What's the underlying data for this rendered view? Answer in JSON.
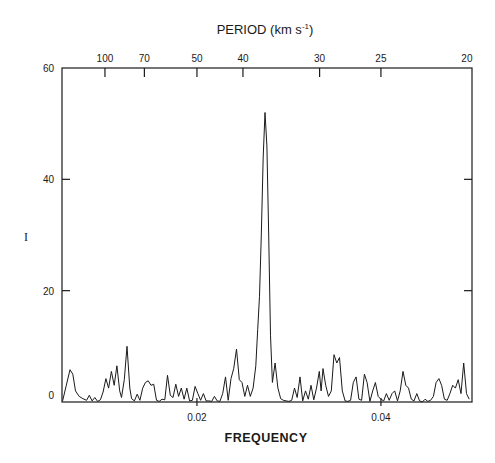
{
  "chart_data": {
    "type": "line",
    "title": "",
    "top_axis_label": "PERIOD (km s",
    "top_axis_label_sup": "-1",
    "top_axis_label_close": ")",
    "xlabel": "FREQUENCY",
    "ylabel": "I",
    "xlim": [
      0.00533,
      0.0499
    ],
    "ylim": [
      0,
      60
    ],
    "y_ticks": [
      0,
      20,
      40,
      60
    ],
    "y_tick_labels": [
      "0",
      "20",
      "40",
      "60"
    ],
    "x_ticks": [
      0.02,
      0.04
    ],
    "x_tick_labels": [
      "0.02",
      "0.04"
    ],
    "top_ticks_period": [
      100,
      70,
      50,
      40,
      30,
      25,
      20
    ],
    "top_tick_labels": [
      "100",
      "70",
      "50",
      "40",
      "30",
      "25",
      "20"
    ],
    "grid": false,
    "legend": null,
    "line_color": "#1a1a1a",
    "series": [
      {
        "name": "power spectrum",
        "x": [
          0.0054,
          0.0058,
          0.0062,
          0.0065,
          0.0068,
          0.0072,
          0.0076,
          0.008,
          0.0083,
          0.0086,
          0.0089,
          0.0092,
          0.0095,
          0.0098,
          0.0101,
          0.0104,
          0.0107,
          0.011,
          0.0113,
          0.0116,
          0.0118,
          0.0121,
          0.0124,
          0.0127,
          0.0129,
          0.0132,
          0.0135,
          0.0138,
          0.0141,
          0.0144,
          0.0147,
          0.015,
          0.0153,
          0.0156,
          0.0159,
          0.0162,
          0.0165,
          0.0168,
          0.0171,
          0.0174,
          0.0177,
          0.018,
          0.0183,
          0.0186,
          0.0189,
          0.0192,
          0.0195,
          0.0198,
          0.0201,
          0.0204,
          0.0207,
          0.021,
          0.0213,
          0.0216,
          0.0219,
          0.0222,
          0.0225,
          0.0228,
          0.0231,
          0.0234,
          0.0237,
          0.024,
          0.0243,
          0.0246,
          0.0249,
          0.0252,
          0.0255,
          0.0258,
          0.0261,
          0.0264,
          0.0266,
          0.0268,
          0.027,
          0.0272,
          0.0274,
          0.0276,
          0.0278,
          0.028,
          0.0282,
          0.0285,
          0.0288,
          0.0291,
          0.0294,
          0.0297,
          0.03,
          0.0303,
          0.0306,
          0.0309,
          0.0312,
          0.0315,
          0.0318,
          0.0321,
          0.0324,
          0.0327,
          0.033,
          0.0333,
          0.0335,
          0.0337,
          0.034,
          0.0343,
          0.0346,
          0.0349,
          0.0352,
          0.0355,
          0.0358,
          0.0361,
          0.0364,
          0.0367,
          0.037,
          0.0373,
          0.0376,
          0.0379,
          0.0382,
          0.0385,
          0.0388,
          0.0391,
          0.0394,
          0.0397,
          0.04,
          0.0403,
          0.0406,
          0.0409,
          0.0412,
          0.0415,
          0.0418,
          0.0421,
          0.0424,
          0.0427,
          0.043,
          0.0433,
          0.0436,
          0.0439,
          0.0442,
          0.0445,
          0.0448,
          0.0451,
          0.0454,
          0.0457,
          0.046,
          0.0463,
          0.0466,
          0.0469,
          0.0472,
          0.0475,
          0.0478,
          0.0481,
          0.0484,
          0.0487,
          0.049,
          0.0493,
          0.0496
        ],
        "y": [
          0.2,
          3.0,
          5.8,
          5.0,
          2.0,
          1.0,
          0.6,
          0.3,
          1.2,
          0.2,
          0.8,
          0.1,
          0.4,
          1.8,
          4.2,
          2.5,
          5.5,
          3.0,
          6.5,
          2.0,
          0.8,
          4.0,
          10.0,
          2.5,
          0.6,
          0.2,
          1.4,
          0.3,
          2.5,
          3.5,
          3.8,
          3.0,
          3.2,
          0.3,
          0.1,
          0.5,
          0.4,
          4.8,
          1.2,
          0.8,
          3.2,
          1.0,
          2.5,
          0.5,
          2.5,
          0.2,
          0.3,
          2.8,
          1.5,
          0.3,
          1.5,
          0.2,
          0.2,
          0.1,
          1.0,
          0.2,
          0.1,
          1.5,
          4.5,
          0.3,
          4.2,
          6.0,
          9.5,
          4.0,
          3.5,
          1.0,
          3.0,
          1.0,
          2.5,
          6.5,
          13.0,
          19.0,
          30.0,
          44.0,
          52.0,
          46.0,
          30.0,
          12.0,
          3.5,
          7.0,
          2.5,
          0.6,
          0.3,
          0.2,
          0.1,
          0.3,
          2.5,
          0.8,
          4.5,
          0.2,
          2.0,
          0.5,
          3.0,
          0.4,
          2.5,
          5.5,
          2.0,
          6.0,
          3.0,
          1.0,
          2.0,
          8.5,
          7.0,
          8.0,
          2.0,
          0.2,
          0.1,
          0.3,
          3.5,
          4.5,
          0.5,
          0.3,
          5.0,
          3.5,
          0.1,
          2.0,
          3.5,
          1.0,
          0.5,
          0.2,
          1.5,
          0.3,
          1.5,
          2.0,
          0.2,
          2.0,
          5.5,
          3.0,
          2.5,
          0.5,
          0.2,
          1.5,
          0.2,
          0.0,
          0.5,
          0.1,
          0.3,
          1.0,
          3.5,
          4.2,
          3.0,
          0.5,
          0.3,
          1.5,
          3.0,
          2.5,
          4.0,
          1.5,
          7.0,
          1.5,
          0.5
        ]
      }
    ]
  },
  "plot_box": {
    "left": 62,
    "right": 472,
    "top": 68,
    "bottom": 402
  }
}
